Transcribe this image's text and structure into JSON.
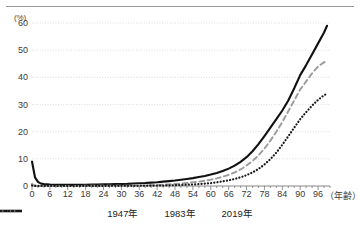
{
  "chart_data": {
    "type": "line",
    "title": "",
    "subtitle": "",
    "xlabel": "（年齢）",
    "ylabel": "(%)",
    "yunit": "(%)",
    "xlim": [
      0,
      100
    ],
    "ylim": [
      0,
      60
    ],
    "grid": true,
    "legend_position": "bottom",
    "yticks": [
      60,
      50,
      40,
      30,
      20,
      10,
      0
    ],
    "xticks": [
      0,
      6,
      12,
      18,
      24,
      30,
      36,
      42,
      48,
      54,
      60,
      66,
      72,
      78,
      84,
      90,
      96
    ],
    "x": [
      0,
      1,
      2,
      3,
      4,
      5,
      6,
      8,
      10,
      12,
      14,
      16,
      18,
      20,
      22,
      24,
      26,
      28,
      30,
      32,
      34,
      36,
      38,
      40,
      42,
      44,
      46,
      48,
      50,
      52,
      54,
      56,
      58,
      60,
      62,
      64,
      66,
      68,
      70,
      72,
      74,
      76,
      78,
      80,
      82,
      84,
      86,
      88,
      90,
      92,
      94,
      96,
      98,
      99
    ],
    "series": [
      {
        "name": "1947年",
        "style": "solid",
        "color": "#111111",
        "values": [
          9.0,
          3.2,
          1.5,
          0.9,
          0.7,
          0.6,
          0.5,
          0.45,
          0.4,
          0.4,
          0.4,
          0.4,
          0.45,
          0.5,
          0.55,
          0.6,
          0.65,
          0.7,
          0.75,
          0.8,
          0.9,
          1.0,
          1.1,
          1.25,
          1.4,
          1.6,
          1.8,
          2.0,
          2.3,
          2.6,
          2.9,
          3.3,
          3.7,
          4.2,
          4.8,
          5.5,
          6.4,
          7.5,
          8.9,
          10.6,
          12.8,
          15.4,
          18.4,
          21.5,
          24.6,
          27.8,
          31.5,
          36.0,
          40.8,
          44.5,
          48.5,
          52.5,
          56.5,
          59.0
        ]
      },
      {
        "name": "1983年",
        "style": "dashed",
        "color": "#9b9b9b",
        "values": [
          0.8,
          0.1,
          0.07,
          0.05,
          0.05,
          0.04,
          0.04,
          0.04,
          0.04,
          0.04,
          0.05,
          0.06,
          0.07,
          0.07,
          0.07,
          0.08,
          0.08,
          0.09,
          0.1,
          0.12,
          0.15,
          0.19,
          0.24,
          0.3,
          0.38,
          0.48,
          0.6,
          0.74,
          0.9,
          1.1,
          1.35,
          1.6,
          1.95,
          2.35,
          2.8,
          3.4,
          4.1,
          5.0,
          6.1,
          7.5,
          9.2,
          11.3,
          13.8,
          16.7,
          20.0,
          23.6,
          27.5,
          31.5,
          35.5,
          38.5,
          41.5,
          44.0,
          45.5,
          46.0
        ]
      },
      {
        "name": "2019年",
        "style": "dotted",
        "color": "#1a1a1a",
        "values": [
          0.2,
          0.03,
          0.02,
          0.02,
          0.02,
          0.02,
          0.02,
          0.02,
          0.02,
          0.02,
          0.02,
          0.03,
          0.03,
          0.04,
          0.04,
          0.04,
          0.05,
          0.05,
          0.05,
          0.06,
          0.07,
          0.08,
          0.1,
          0.12,
          0.15,
          0.18,
          0.23,
          0.29,
          0.36,
          0.45,
          0.56,
          0.7,
          0.87,
          1.08,
          1.35,
          1.7,
          2.1,
          2.6,
          3.2,
          4.0,
          5.0,
          6.3,
          7.9,
          9.9,
          12.3,
          15.2,
          18.3,
          21.5,
          24.6,
          27.2,
          29.6,
          31.7,
          33.4,
          34.0
        ]
      }
    ]
  },
  "legend": {
    "items": [
      {
        "label": "1947年",
        "style": "solid"
      },
      {
        "label": "1983年",
        "style": "dashed"
      },
      {
        "label": "2019年",
        "style": "dotted"
      }
    ]
  },
  "colors": {
    "series_1947": "#111111",
    "series_1983": "#9b9b9b",
    "series_2019": "#1a1a1a",
    "grid": "#d9d9d9",
    "axis": "#7a7a7a"
  }
}
